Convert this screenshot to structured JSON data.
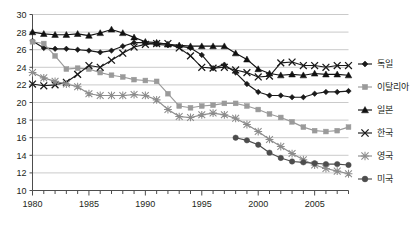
{
  "chart_data": {
    "type": "line",
    "title": "",
    "xlabel": "",
    "ylabel": "",
    "xlim": [
      1980,
      2008
    ],
    "ylim": [
      10,
      30
    ],
    "ytick_step": 2,
    "yticks": [
      10,
      12,
      14,
      16,
      18,
      20,
      22,
      24,
      26,
      28,
      30
    ],
    "xticks": [
      1980,
      1985,
      1990,
      1995,
      2000,
      2005
    ],
    "x_minor_step": 1,
    "grid": "horizontal",
    "legend_position": "right",
    "x": [
      1980,
      1981,
      1982,
      1983,
      1984,
      1985,
      1986,
      1987,
      1988,
      1989,
      1990,
      1991,
      1992,
      1993,
      1994,
      1995,
      1996,
      1997,
      1998,
      1999,
      2000,
      2001,
      2002,
      2003,
      2004,
      2005,
      2006,
      2007,
      2008
    ],
    "series": [
      {
        "name": "독일",
        "marker": "diamond",
        "color": "#1a1a1a",
        "values": [
          27.0,
          26.2,
          26.1,
          26.1,
          26.0,
          25.9,
          25.7,
          25.9,
          26.4,
          26.8,
          26.8,
          26.6,
          26.5,
          26.4,
          26.2,
          25.4,
          23.9,
          24.3,
          23.4,
          22.1,
          21.2,
          20.8,
          20.8,
          20.6,
          20.6,
          21.0,
          21.2,
          21.2,
          21.3
        ]
      },
      {
        "name": "이탈리아",
        "marker": "square",
        "color": "#9a9a9a",
        "values": [
          26.9,
          26.7,
          25.3,
          23.8,
          23.9,
          23.8,
          23.4,
          23.1,
          22.9,
          22.6,
          22.5,
          22.4,
          21.0,
          19.6,
          19.4,
          19.6,
          19.7,
          19.9,
          19.9,
          19.6,
          19.2,
          18.7,
          18.3,
          17.8,
          17.2,
          16.8,
          16.7,
          16.8,
          17.2
        ]
      },
      {
        "name": "일본",
        "marker": "triangle",
        "color": "#111111",
        "values": [
          28.0,
          27.8,
          27.7,
          27.7,
          27.8,
          27.6,
          27.9,
          28.3,
          27.9,
          27.4,
          26.9,
          26.8,
          26.6,
          26.5,
          26.4,
          26.4,
          26.4,
          26.4,
          25.6,
          24.9,
          23.8,
          23.3,
          23.1,
          23.2,
          23.1,
          23.3,
          23.2,
          23.2,
          23.1
        ]
      },
      {
        "name": "한국",
        "marker": "x",
        "color": "#1a1a1a",
        "values": [
          22.1,
          21.9,
          22.0,
          22.3,
          23.2,
          24.2,
          24.0,
          24.8,
          25.6,
          26.3,
          26.6,
          26.7,
          26.7,
          26.2,
          25.3,
          24.0,
          23.9,
          24.0,
          23.7,
          23.4,
          22.9,
          23.0,
          24.5,
          24.6,
          24.2,
          24.2,
          24.0,
          24.2,
          24.2
        ]
      },
      {
        "name": "영국",
        "marker": "asterisk",
        "color": "#8d8d8d",
        "values": [
          23.4,
          22.8,
          22.4,
          22.1,
          21.8,
          21.0,
          20.8,
          20.8,
          20.8,
          20.9,
          20.8,
          20.3,
          19.2,
          18.4,
          18.3,
          18.6,
          18.8,
          18.6,
          18.2,
          17.5,
          16.7,
          15.8,
          15.0,
          14.2,
          13.5,
          12.9,
          12.5,
          12.2,
          11.9
        ]
      },
      {
        "name": "미국",
        "marker": "circle",
        "color": "#4d4d4d",
        "values": [
          null,
          null,
          null,
          null,
          null,
          null,
          null,
          null,
          null,
          null,
          null,
          null,
          null,
          null,
          null,
          null,
          null,
          null,
          16.0,
          15.7,
          15.2,
          14.3,
          13.7,
          13.3,
          13.2,
          13.1,
          13.0,
          13.0,
          12.9
        ]
      }
    ]
  },
  "legend": {
    "items": [
      {
        "label": "독일"
      },
      {
        "label": "이탈리아"
      },
      {
        "label": "일본"
      },
      {
        "label": "한국"
      },
      {
        "label": "영국"
      },
      {
        "label": "미국"
      }
    ]
  },
  "axes": {
    "y_labels": [
      "30",
      "28",
      "26",
      "24",
      "22",
      "20",
      "18",
      "16",
      "14",
      "12",
      "10"
    ],
    "x_labels": [
      "1980",
      "1985",
      "1990",
      "1995",
      "2000",
      "2005"
    ]
  }
}
